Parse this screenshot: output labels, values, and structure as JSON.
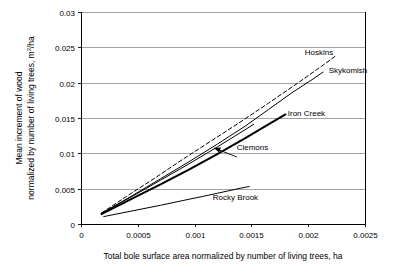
{
  "chart_data": {
    "type": "line",
    "title": "",
    "xlabel": "Total bole surface area normalized by number of living trees, ha",
    "ylabel_line1": "Mean increment of wood",
    "ylabel_line2": "normalized by number of living trees, m³/ha",
    "ylabel_full": "Mean increment of wood normalized by number of living trees, m3/ha",
    "xlim": [
      0,
      0.0025
    ],
    "ylim": [
      0,
      0.03
    ],
    "xticks": [
      0,
      0.0005,
      0.001,
      0.0015,
      0.002,
      0.0025
    ],
    "xticklabels": [
      "0",
      "0.0005",
      "0.001",
      "0.0015",
      "0.002",
      "0.0025"
    ],
    "yticks": [
      0,
      0.005,
      0.01,
      0.015,
      0.02,
      0.025,
      0.03
    ],
    "yticklabels": [
      "0",
      "0.005",
      "0.01",
      "0.015",
      "0.02",
      "0.025",
      "0.03"
    ],
    "grid": "horizontal",
    "legend": "inline-labels",
    "series": [
      {
        "name": "Hoskins",
        "style": "dashed",
        "width": 1.0,
        "color": "#000000",
        "points": [
          [
            0.00018,
            0.00155
          ],
          [
            0.0004,
            0.0039
          ],
          [
            0.00065,
            0.0065
          ],
          [
            0.0009,
            0.0092
          ],
          [
            0.00115,
            0.0118
          ],
          [
            0.0014,
            0.0144
          ],
          [
            0.00165,
            0.0171
          ],
          [
            0.0019,
            0.01985
          ],
          [
            0.00215,
            0.0227
          ],
          [
            0.00225,
            0.0239
          ]
        ]
      },
      {
        "name": "Skykomish",
        "style": "solid",
        "width": 1.0,
        "color": "#000000",
        "points": [
          [
            0.00018,
            0.0015
          ],
          [
            0.00045,
            0.004
          ],
          [
            0.0007,
            0.0064
          ],
          [
            0.00095,
            0.0088
          ],
          [
            0.0012,
            0.0113
          ],
          [
            0.00145,
            0.0139
          ],
          [
            0.00165,
            0.0162
          ],
          [
            0.00185,
            0.0185
          ],
          [
            0.00205,
            0.0206
          ],
          [
            0.00213,
            0.0215
          ]
        ]
      },
      {
        "name": "Iron Creek",
        "style": "solid",
        "width": 2.0,
        "color": "#000000",
        "points": [
          [
            0.00018,
            0.0014
          ],
          [
            0.00045,
            0.0036
          ],
          [
            0.0007,
            0.0056
          ],
          [
            0.00095,
            0.0077
          ],
          [
            0.0012,
            0.0099
          ],
          [
            0.00145,
            0.0122
          ],
          [
            0.00165,
            0.0141
          ],
          [
            0.0018,
            0.0155
          ]
        ]
      },
      {
        "name": "Clemons",
        "style": "solid",
        "width": 1.0,
        "color": "#000000",
        "points": [
          [
            0.00018,
            0.0015
          ],
          [
            0.00045,
            0.0039
          ],
          [
            0.0007,
            0.0062
          ],
          [
            0.00095,
            0.0085
          ],
          [
            0.0012,
            0.0109
          ],
          [
            0.0014,
            0.0129
          ],
          [
            0.00152,
            0.0141
          ]
        ]
      },
      {
        "name": "Rocky Brook",
        "style": "solid",
        "width": 1.0,
        "color": "#000000",
        "points": [
          [
            0.0002,
            0.00105
          ],
          [
            0.00045,
            0.00185
          ],
          [
            0.0007,
            0.00265
          ],
          [
            0.00095,
            0.0035
          ],
          [
            0.0011,
            0.004
          ],
          [
            0.0012,
            0.00435
          ],
          [
            0.0013,
            0.0047
          ],
          [
            0.0014,
            0.00505
          ],
          [
            0.00148,
            0.0053
          ]
        ]
      }
    ],
    "annotations": [
      {
        "text": "Hoskins",
        "x": 0.00197,
        "y": 0.02435
      },
      {
        "text": "Skykomish",
        "x": 0.00218,
        "y": 0.0218
      },
      {
        "text": "Iron Creek",
        "x": 0.00182,
        "y": 0.01565
      },
      {
        "text": "Clemons",
        "x": 0.00137,
        "y": 0.01095
      },
      {
        "text": "Rocky Brook",
        "x": 0.00116,
        "y": 0.00378
      }
    ]
  },
  "colors": {
    "axis": "#000000",
    "grid": "#808080",
    "plot_background": "#ffffff",
    "series": "#000000"
  }
}
